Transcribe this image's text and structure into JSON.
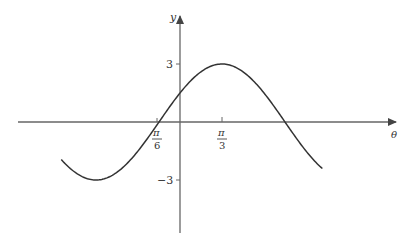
{
  "chart_data": {
    "type": "line",
    "title": "",
    "function": "y = 3 sin(θ + π/6)",
    "xlabel": "θ",
    "ylabel": "y",
    "x_ticks": [
      {
        "value": "-π/6",
        "label_num": "π",
        "label_den": "6"
      },
      {
        "value": "π/3",
        "label_num": "π",
        "label_den": "3"
      }
    ],
    "y_ticks": [
      {
        "value": 3,
        "label": "3"
      },
      {
        "value": -3,
        "label": "−3"
      }
    ],
    "series": [
      {
        "name": "curve",
        "amplitude": 3,
        "zero_crossing": "-π/6",
        "maximum": {
          "x": "π/3",
          "y": 3
        },
        "minima_y": -3,
        "x_range_radians": [
          -2.96,
          3.55
        ]
      }
    ],
    "ylim": [
      -5,
      5
    ],
    "grid": false,
    "legend": null
  },
  "colors": {
    "axis": "#555555",
    "curve": "#333333",
    "text": "#333333"
  }
}
